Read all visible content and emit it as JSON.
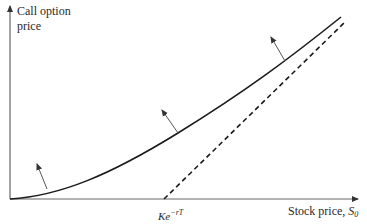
{
  "diagram": {
    "y_axis_label": "Call option price",
    "x_axis_label": "Stock price, ",
    "x_axis_symbol": "S",
    "x_axis_symbol_sub": "0",
    "strike_marker_base": "Ke",
    "strike_marker_exp": "−rT",
    "curves": [
      {
        "name": "call-price-curve",
        "style": "solid"
      },
      {
        "name": "lower-bound-line",
        "style": "dashed",
        "description": "S0 − Ke^(−rT)"
      }
    ],
    "arrows_count": 3,
    "colors": {
      "line": "#1a1a1a",
      "axis": "#555555",
      "arrow": "#444444"
    }
  }
}
